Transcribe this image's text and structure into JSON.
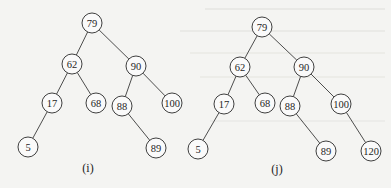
{
  "figure": {
    "type": "binary-search-tree-comparison",
    "node_radius": 10,
    "colors": {
      "stroke": "#2a2a2a",
      "node_fill": "#fafafa",
      "background": "#f4f4f2"
    }
  },
  "trees": [
    {
      "id": "i",
      "caption": "(i)",
      "caption_pos": [
        88,
        172
      ],
      "nodes": [
        {
          "id": "79",
          "label": "79",
          "x": 92,
          "y": 23
        },
        {
          "id": "62",
          "label": "62",
          "x": 72,
          "y": 64
        },
        {
          "id": "90",
          "label": "90",
          "x": 136,
          "y": 66
        },
        {
          "id": "17",
          "label": "17",
          "x": 52,
          "y": 103
        },
        {
          "id": "68",
          "label": "68",
          "x": 96,
          "y": 103
        },
        {
          "id": "88",
          "label": "88",
          "x": 122,
          "y": 106
        },
        {
          "id": "100",
          "label": "100",
          "x": 172,
          "y": 103
        },
        {
          "id": "5",
          "label": "5",
          "x": 28,
          "y": 147
        },
        {
          "id": "89",
          "label": "89",
          "x": 156,
          "y": 148
        }
      ],
      "edges": [
        [
          "79",
          "62"
        ],
        [
          "79",
          "90"
        ],
        [
          "62",
          "17"
        ],
        [
          "62",
          "68"
        ],
        [
          "90",
          "88"
        ],
        [
          "90",
          "100"
        ],
        [
          "17",
          "5"
        ],
        [
          "88",
          "89"
        ]
      ]
    },
    {
      "id": "j",
      "caption": "(j)",
      "caption_pos": [
        277,
        173
      ],
      "nodes": [
        {
          "id": "79",
          "label": "79",
          "x": 262,
          "y": 27
        },
        {
          "id": "62",
          "label": "62",
          "x": 240,
          "y": 67
        },
        {
          "id": "90",
          "label": "90",
          "x": 304,
          "y": 67
        },
        {
          "id": "17",
          "label": "17",
          "x": 224,
          "y": 104
        },
        {
          "id": "68",
          "label": "68",
          "x": 265,
          "y": 103
        },
        {
          "id": "88",
          "label": "88",
          "x": 290,
          "y": 106
        },
        {
          "id": "100",
          "label": "100",
          "x": 341,
          "y": 104
        },
        {
          "id": "5",
          "label": "5",
          "x": 198,
          "y": 149
        },
        {
          "id": "89",
          "label": "89",
          "x": 326,
          "y": 151
        },
        {
          "id": "120",
          "label": "120",
          "x": 371,
          "y": 151
        }
      ],
      "edges": [
        [
          "79",
          "62"
        ],
        [
          "79",
          "90"
        ],
        [
          "62",
          "17"
        ],
        [
          "62",
          "68"
        ],
        [
          "90",
          "88"
        ],
        [
          "90",
          "100"
        ],
        [
          "17",
          "5"
        ],
        [
          "88",
          "89"
        ],
        [
          "100",
          "120"
        ]
      ]
    }
  ]
}
